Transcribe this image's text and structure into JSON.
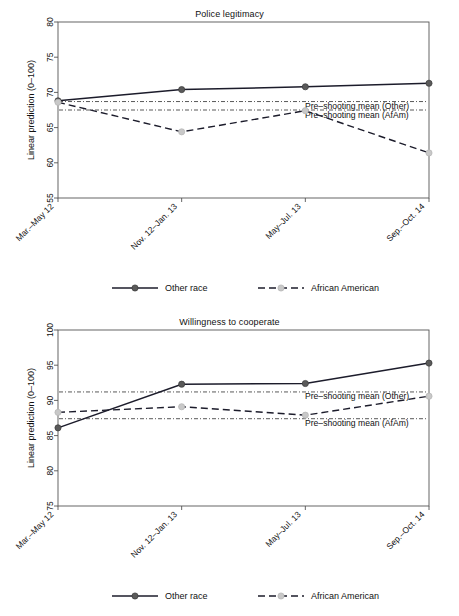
{
  "figure": {
    "width": 459,
    "height": 616,
    "background": "#ffffff",
    "series_colors": {
      "other_race_line": "#1c1c2b",
      "other_race_marker": "#5a5a5a",
      "african_american_line": "#1c1c2b",
      "african_american_marker": "#c8c8c8",
      "frame": "#555555"
    }
  },
  "legend": {
    "items": [
      {
        "label": "Other race",
        "style": "solid",
        "marker": "dark-circle"
      },
      {
        "label": "African American",
        "style": "dashed",
        "marker": "light-circle"
      }
    ]
  },
  "chart_data": [
    {
      "type": "line",
      "title": "Police legitimacy",
      "xlabel": "",
      "ylabel": "Linear prediction (0–100)",
      "categories": [
        "Mar.–May 12",
        "Nov. 12–Jan. 13",
        "May–Jul. 13",
        "Sep.–Oct. 14"
      ],
      "ylim": [
        55,
        80
      ],
      "yticks": [
        55,
        60,
        65,
        70,
        75,
        80
      ],
      "grid": false,
      "legend_position": "bottom",
      "series": [
        {
          "name": "Other race",
          "values": [
            68.8,
            70.4,
            70.8,
            71.3
          ],
          "style": "solid",
          "marker": "dark-circle"
        },
        {
          "name": "African American",
          "values": [
            68.6,
            64.4,
            67.4,
            61.4
          ],
          "style": "dashed",
          "marker": "light-circle"
        }
      ],
      "reference_lines": [
        {
          "label": "Pre–shooting mean (Other)",
          "value": 68.7,
          "style": "dash-dot"
        },
        {
          "label": "Pre–shooting mean (AfAm)",
          "value": 67.5,
          "style": "dash-dot"
        }
      ]
    },
    {
      "type": "line",
      "title": "Willingness to cooperate",
      "xlabel": "",
      "ylabel": "Linear prediction (0–100)",
      "categories": [
        "Mar.–May 12",
        "Nov. 12–Jan. 13",
        "May–Jul. 13",
        "Sep.–Oct. 14"
      ],
      "ylim": [
        75,
        100
      ],
      "yticks": [
        75,
        80,
        85,
        90,
        95,
        100
      ],
      "grid": false,
      "legend_position": "bottom",
      "series": [
        {
          "name": "Other race",
          "values": [
            86.1,
            92.3,
            92.4,
            95.3
          ],
          "style": "solid",
          "marker": "dark-circle"
        },
        {
          "name": "African American",
          "values": [
            88.3,
            89.1,
            87.9,
            90.6
          ],
          "style": "dashed",
          "marker": "light-circle"
        }
      ],
      "reference_lines": [
        {
          "label": "Pre–shooting mean (Other)",
          "value": 91.2,
          "style": "dash-dot"
        },
        {
          "label": "Pre–shooting mean (AfAm)",
          "value": 87.4,
          "style": "dash-dot"
        }
      ]
    }
  ]
}
